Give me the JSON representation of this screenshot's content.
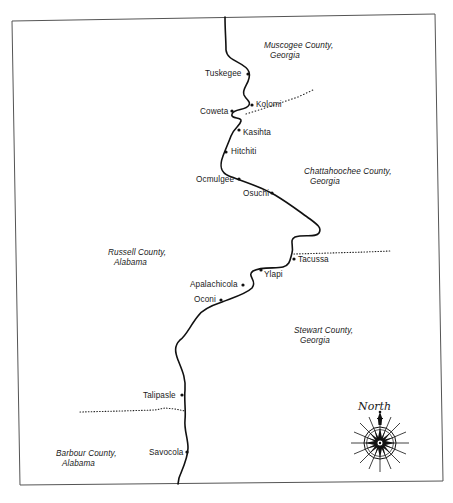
{
  "map": {
    "frame_color": "#555555",
    "river_color": "#111111",
    "boundary_color": "#222222",
    "counties": [
      {
        "line1": "Muscogee County,",
        "line2": "Georgia",
        "x": 264,
        "y": 41
      },
      {
        "line1": "Chattahoochee County,",
        "line2": "Georgia",
        "x": 304,
        "y": 167
      },
      {
        "line1": "Russell County,",
        "line2": "Alabama",
        "x": 108,
        "y": 248
      },
      {
        "line1": "Stewart County,",
        "line2": "Georgia",
        "x": 294,
        "y": 326
      },
      {
        "line1": "Barbour County,",
        "line2": "Alabama",
        "x": 56,
        "y": 449
      }
    ],
    "towns": [
      {
        "name": "Tuskegee",
        "label_x": 205,
        "label_y": 69,
        "dot_x": 248,
        "dot_y": 74
      },
      {
        "name": "Kolomi",
        "label_x": 256,
        "label_y": 100,
        "dot_x": 252,
        "dot_y": 105
      },
      {
        "name": "Coweta",
        "label_x": 200,
        "label_y": 107,
        "dot_x": 232,
        "dot_y": 111
      },
      {
        "name": "Kasihta",
        "label_x": 243,
        "label_y": 128,
        "dot_x": 239,
        "dot_y": 130
      },
      {
        "name": "Hitchiti",
        "label_x": 231,
        "label_y": 147,
        "dot_x": 226,
        "dot_y": 152
      },
      {
        "name": "Ocmulgee",
        "label_x": 196,
        "label_y": 175,
        "dot_x": 239,
        "dot_y": 179
      },
      {
        "name": "Osuchi",
        "label_x": 243,
        "label_y": 189,
        "dot_x": 272,
        "dot_y": 193
      },
      {
        "name": "Tacussa",
        "label_x": 298,
        "label_y": 255,
        "dot_x": 294,
        "dot_y": 259
      },
      {
        "name": "Ylapi",
        "label_x": 264,
        "label_y": 270,
        "dot_x": 261,
        "dot_y": 270
      },
      {
        "name": "Apalachicola",
        "label_x": 190,
        "label_y": 280,
        "dot_x": 243,
        "dot_y": 285
      },
      {
        "name": "Oconi",
        "label_x": 194,
        "label_y": 295,
        "dot_x": 221,
        "dot_y": 300
      },
      {
        "name": "Talipasle",
        "label_x": 143,
        "label_y": 391,
        "dot_x": 182,
        "dot_y": 395
      },
      {
        "name": "Savocola",
        "label_x": 149,
        "label_y": 448,
        "dot_x": 187,
        "dot_y": 452
      }
    ],
    "compass": {
      "label": "North",
      "label_x": 356,
      "label_y": 402,
      "cx": 380,
      "cy": 443,
      "ring_r": 16,
      "ray_r": 29
    }
  }
}
